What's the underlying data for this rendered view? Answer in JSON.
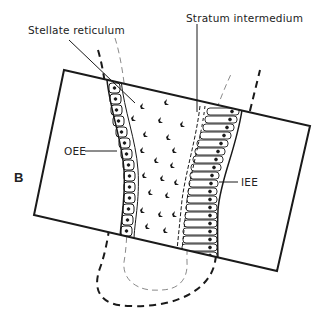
{
  "figure": {
    "panel_letter": "B",
    "labels": {
      "stellate_reticulum": "Stellate reticulum",
      "stratum_intermedium": "Stratum intermedium",
      "oee": "OEE",
      "iee": "IEE"
    },
    "colors": {
      "ink": "#1a1a1a",
      "light_ink": "#8a8a8a",
      "background": "#ffffff"
    }
  }
}
